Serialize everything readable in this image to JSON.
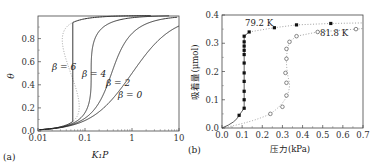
{
  "chart_data": [
    {
      "panel": "(a)",
      "type": "line",
      "title": "",
      "xlabel": "K₁P",
      "ylabel": "θ",
      "xscale": "log",
      "xlim": [
        0.01,
        10
      ],
      "ylim": [
        0,
        1
      ],
      "xticks": [
        0.01,
        0.1,
        1,
        10
      ],
      "xtick_labels": [
        "0.01",
        "0.1",
        "1",
        "10"
      ],
      "yticks": [
        0.0,
        0.2,
        0.4,
        0.6,
        0.8
      ],
      "ytick_labels": [
        "0.0",
        "0.2",
        "0.4",
        "0.6",
        "0.8"
      ],
      "series": [
        {
          "name": "β=0",
          "label": "β = 0",
          "beta": 0,
          "style": "solid"
        },
        {
          "name": "β=2",
          "label": "β = 2",
          "beta": 2,
          "style": "solid"
        },
        {
          "name": "β=4",
          "label": "β = 4",
          "beta": 4,
          "style": "solid"
        },
        {
          "name": "β=6",
          "label": "β = 6",
          "beta": 6,
          "style": "solid",
          "transition_x": 0.055,
          "unstable_loop": "dotted"
        }
      ],
      "model": "θ/(1-θ)·exp(-βθ) = K₁P"
    },
    {
      "panel": "(b)",
      "type": "scatter",
      "title": "",
      "xlabel": "压力(kPa)",
      "ylabel": "吸着量(μmol)",
      "xlim": [
        0,
        0.7
      ],
      "ylim": [
        0,
        0.4
      ],
      "xticks": [
        0,
        0.1,
        0.2,
        0.3,
        0.4,
        0.5,
        0.6,
        0.7
      ],
      "xtick_labels": [
        "0.0",
        "0.1",
        "0.2",
        "0.3",
        "0.4",
        "0.5",
        "0.6",
        "0.7"
      ],
      "yticks": [
        0,
        0.1,
        0.2,
        0.3,
        0.4
      ],
      "ytick_labels": [
        "0.0",
        "0.1",
        "0.2",
        "0.3",
        "0.4"
      ],
      "series": [
        {
          "name": "79.2 K",
          "label": "79.2 K",
          "marker": "filled-square",
          "x": [
            0.085,
            0.11,
            0.11,
            0.11,
            0.11,
            0.11,
            0.11,
            0.11,
            0.11,
            0.11,
            0.11,
            0.11,
            0.135,
            0.26,
            0.37,
            0.54
          ],
          "y": [
            0.045,
            0.07,
            0.1,
            0.13,
            0.165,
            0.195,
            0.23,
            0.26,
            0.275,
            0.29,
            0.305,
            0.325,
            0.34,
            0.355,
            0.365,
            0.37
          ]
        },
        {
          "name": "81.8 K",
          "label": "81.8 K",
          "marker": "open-circle",
          "x": [
            0.24,
            0.3,
            0.32,
            0.32,
            0.315,
            0.32,
            0.32,
            0.335,
            0.37,
            0.475,
            0.665
          ],
          "y": [
            0.05,
            0.075,
            0.115,
            0.16,
            0.195,
            0.245,
            0.28,
            0.305,
            0.325,
            0.34,
            0.35
          ]
        }
      ]
    }
  ]
}
